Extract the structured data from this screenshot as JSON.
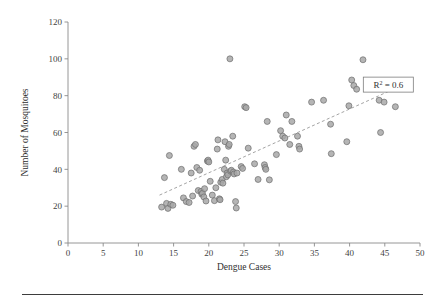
{
  "chart_data": {
    "type": "scatter",
    "title": "",
    "xlabel": "Dengue Cases",
    "ylabel": "Number of Mosquitoes",
    "xlim": [
      0,
      50
    ],
    "ylim": [
      0,
      120
    ],
    "xticks": [
      0,
      5,
      10,
      15,
      20,
      25,
      30,
      35,
      40,
      45,
      50
    ],
    "yticks": [
      0,
      20,
      40,
      60,
      80,
      100,
      120
    ],
    "grid": false,
    "legend": null,
    "annotations": [
      {
        "name": "r-squared-box",
        "text": "R2 = 0.6",
        "text_base": "R",
        "text_sup": "2",
        "text_rest": " = 0.6",
        "x": 45.5,
        "y": 86,
        "boxed": true
      }
    ],
    "trendline": {
      "type": "linear",
      "dashed": true,
      "x_start": 13.0,
      "y_start": 26.0,
      "x_end": 46.5,
      "y_end": 84.0
    },
    "marker": {
      "shape": "circle",
      "size_px": 3.0,
      "fill_color": "#a8a8a8",
      "edge_color": "#6d6d6d"
    },
    "points": [
      [
        13.3,
        19.5
      ],
      [
        13.7,
        35.5
      ],
      [
        14.0,
        21.5
      ],
      [
        14.2,
        18.8
      ],
      [
        14.4,
        47.5
      ],
      [
        14.6,
        21.0
      ],
      [
        14.9,
        20.5
      ],
      [
        16.1,
        40.0
      ],
      [
        16.4,
        24.5
      ],
      [
        16.8,
        22.5
      ],
      [
        17.2,
        22.0
      ],
      [
        17.5,
        38.0
      ],
      [
        17.7,
        25.5
      ],
      [
        17.9,
        52.5
      ],
      [
        18.1,
        53.5
      ],
      [
        18.3,
        41.0
      ],
      [
        18.5,
        28.5
      ],
      [
        18.7,
        39.5
      ],
      [
        18.9,
        28.0
      ],
      [
        19.0,
        26.5
      ],
      [
        19.1,
        27.0
      ],
      [
        19.3,
        25.0
      ],
      [
        19.4,
        29.5
      ],
      [
        19.6,
        22.8
      ],
      [
        19.8,
        44.5
      ],
      [
        19.9,
        45.0
      ],
      [
        20.0,
        44.0
      ],
      [
        20.2,
        33.5
      ],
      [
        20.5,
        26.0
      ],
      [
        20.8,
        23.0
      ],
      [
        21.0,
        30.0
      ],
      [
        21.2,
        51.0
      ],
      [
        21.3,
        56.0
      ],
      [
        21.5,
        24.0
      ],
      [
        21.6,
        23.5
      ],
      [
        21.7,
        33.0
      ],
      [
        21.9,
        34.5
      ],
      [
        22.0,
        32.5
      ],
      [
        22.2,
        40.0
      ],
      [
        22.3,
        55.0
      ],
      [
        22.4,
        45.0
      ],
      [
        22.5,
        36.0
      ],
      [
        22.6,
        38.0
      ],
      [
        22.7,
        37.0
      ],
      [
        22.8,
        52.5
      ],
      [
        22.9,
        53.5
      ],
      [
        23.0,
        100.0
      ],
      [
        23.1,
        39.0
      ],
      [
        23.2,
        39.5
      ],
      [
        23.4,
        58.0
      ],
      [
        23.5,
        38.5
      ],
      [
        23.6,
        37.5
      ],
      [
        23.8,
        22.5
      ],
      [
        23.9,
        19.0
      ],
      [
        24.0,
        38.0
      ],
      [
        24.6,
        41.5
      ],
      [
        24.8,
        40.5
      ],
      [
        25.1,
        74.0
      ],
      [
        25.3,
        73.5
      ],
      [
        25.6,
        51.5
      ],
      [
        26.5,
        43.0
      ],
      [
        27.0,
        34.5
      ],
      [
        27.9,
        42.5
      ],
      [
        28.0,
        41.0
      ],
      [
        28.1,
        40.0
      ],
      [
        28.3,
        66.0
      ],
      [
        28.6,
        34.3
      ],
      [
        29.6,
        48.0
      ],
      [
        30.2,
        61.0
      ],
      [
        30.5,
        58.0
      ],
      [
        30.8,
        57.0
      ],
      [
        31.0,
        69.5
      ],
      [
        31.5,
        53.5
      ],
      [
        31.8,
        66.0
      ],
      [
        32.6,
        58.0
      ],
      [
        32.8,
        52.5
      ],
      [
        32.9,
        51.0
      ],
      [
        34.6,
        76.5
      ],
      [
        36.3,
        77.5
      ],
      [
        37.3,
        64.5
      ],
      [
        37.4,
        48.5
      ],
      [
        39.6,
        55.0
      ],
      [
        39.9,
        74.5
      ],
      [
        40.3,
        88.5
      ],
      [
        40.6,
        85.5
      ],
      [
        41.0,
        83.5
      ],
      [
        41.9,
        99.5
      ],
      [
        43.9,
        84.0
      ],
      [
        44.2,
        77.5
      ],
      [
        44.4,
        60.0
      ],
      [
        44.9,
        76.5
      ],
      [
        46.5,
        74.0
      ]
    ]
  },
  "figure": {
    "footer_rule_visible": true
  }
}
